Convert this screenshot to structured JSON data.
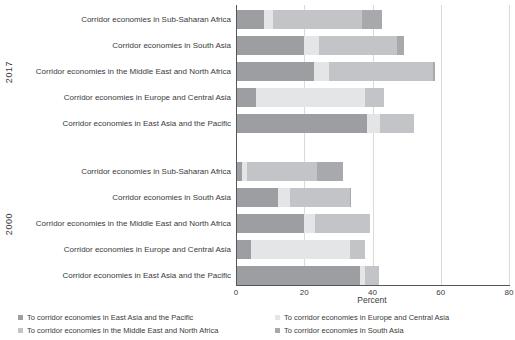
{
  "chart_data": {
    "type": "bar",
    "orientation": "horizontal",
    "stacked": true,
    "xlabel": "Percent",
    "xlim": [
      0,
      80
    ],
    "x_ticks": [
      0,
      20,
      40,
      60,
      80
    ],
    "grid": "vertical",
    "legend_position": "bottom",
    "series_names": [
      "To corridor economies in East Asia and the Pacific",
      "To corridor economies in Europe and Central Asia",
      "To corridor economies in the Middle East and North Africa",
      "To corridor economies in South Asia"
    ],
    "series_colors": [
      "#9c9ea1",
      "#e4e5e7",
      "#c2c4c7",
      "#a7a9ac"
    ],
    "groups": [
      {
        "label": "2017",
        "rows": [
          {
            "category": "Corridor economies in Sub-Saharan Africa",
            "values": [
              8,
              2.5,
              26,
              6
            ]
          },
          {
            "category": "Corridor economies in South Asia",
            "values": [
              19.5,
              4.5,
              23,
              2
            ]
          },
          {
            "category": "Corridor economies in the Middle East and North Africa",
            "values": [
              22.5,
              4.5,
              30.5,
              0.5
            ]
          },
          {
            "category": "Corridor economies in Europe and Central Asia",
            "values": [
              5.5,
              32,
              5.5,
              0
            ]
          },
          {
            "category": "Corridor economies in East Asia and the Pacific",
            "values": [
              38,
              4,
              10,
              0
            ]
          }
        ]
      },
      {
        "label": "2000",
        "rows": [
          {
            "category": "Corridor economies in Sub-Saharan Africa",
            "values": [
              1.5,
              1.5,
              20.5,
              7.5
            ]
          },
          {
            "category": "Corridor economies in South Asia",
            "values": [
              12,
              3.5,
              17.5,
              0.5
            ]
          },
          {
            "category": "Corridor economies in the Middle East and North Africa",
            "values": [
              19.5,
              3.5,
              16,
              0
            ]
          },
          {
            "category": "Corridor economies in Europe and Central Asia",
            "values": [
              4,
              29,
              4.5,
              0
            ]
          },
          {
            "category": "Corridor economies in East Asia and the Pacific",
            "values": [
              36,
              1.5,
              4,
              0
            ]
          }
        ]
      }
    ]
  }
}
